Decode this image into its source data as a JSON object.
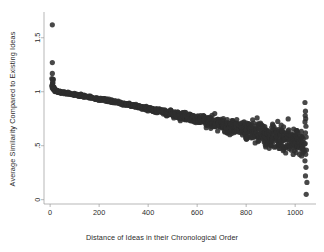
{
  "chart_data": {
    "type": "scatter",
    "title": "",
    "xlabel": "Distance of Ideas in their Chronological Order",
    "ylabel": "Average Similarity Compared to Existing Ideas",
    "xlim": [
      -25,
      1085
    ],
    "ylim": [
      -0.04,
      1.72
    ],
    "xticks": [
      0,
      200,
      400,
      600,
      800,
      1000
    ],
    "xtick_labels": [
      "0",
      "200",
      "400",
      "600",
      "800",
      "1000"
    ],
    "yticks": [
      0,
      0.5,
      1,
      1.5
    ],
    "ytick_labels": [
      "0",
      ".5",
      "1",
      "1.5"
    ],
    "grid": false,
    "legend": null,
    "marker": {
      "shape": "circle",
      "color": "#2f2f2f",
      "size": 2.6
    },
    "trend_line": {
      "color": "#8c8c8c",
      "width": 0.6,
      "points": [
        [
          20,
          1.03
        ],
        [
          200,
          0.93
        ],
        [
          400,
          0.85
        ],
        [
          600,
          0.77
        ],
        [
          800,
          0.66
        ],
        [
          950,
          0.58
        ],
        [
          1040,
          0.53
        ]
      ]
    },
    "series": [
      {
        "name": "Average similarity by chronological distance",
        "points": [
          [
            9,
            1.62
          ],
          [
            9,
            1.27
          ],
          [
            9,
            1.17
          ],
          [
            10,
            1.12
          ],
          [
            11,
            1.08
          ],
          [
            12,
            1.05
          ],
          [
            13,
            1.04
          ],
          [
            14,
            1.03
          ],
          [
            15,
            1.025
          ],
          [
            17,
            1.02
          ],
          [
            19,
            1.015
          ],
          [
            21,
            1.012
          ],
          [
            23,
            1.01
          ],
          [
            25,
            1.008
          ],
          [
            27,
            1.005
          ],
          [
            30,
            1.002
          ],
          [
            33,
            1.0
          ],
          [
            36,
            0.999
          ],
          [
            39,
            0.997
          ],
          [
            42,
            0.996
          ],
          [
            45,
            0.995
          ],
          [
            48,
            0.993
          ],
          [
            52,
            0.992
          ],
          [
            56,
            0.991
          ],
          [
            60,
            0.99
          ],
          [
            64,
            0.988
          ],
          [
            68,
            0.987
          ],
          [
            72,
            0.985
          ],
          [
            76,
            0.984
          ],
          [
            80,
            0.982
          ],
          [
            85,
            0.98
          ],
          [
            90,
            0.978
          ],
          [
            95,
            0.976
          ],
          [
            100,
            0.974
          ],
          [
            105,
            0.972
          ],
          [
            110,
            0.97
          ],
          [
            115,
            0.968
          ],
          [
            120,
            0.966
          ],
          [
            125,
            0.964
          ],
          [
            130,
            0.962
          ],
          [
            135,
            0.96
          ],
          [
            140,
            0.958
          ],
          [
            145,
            0.956
          ],
          [
            150,
            0.954
          ],
          [
            155,
            0.952
          ],
          [
            160,
            0.95
          ],
          [
            165,
            0.948
          ],
          [
            170,
            0.946
          ],
          [
            175,
            0.944
          ],
          [
            180,
            0.942
          ],
          [
            185,
            0.94
          ],
          [
            190,
            0.938
          ],
          [
            195,
            0.936
          ],
          [
            200,
            0.934
          ],
          [
            205,
            0.932
          ],
          [
            210,
            0.93
          ],
          [
            215,
            0.928
          ],
          [
            220,
            0.926
          ],
          [
            225,
            0.923
          ],
          [
            230,
            0.921
          ],
          [
            235,
            0.919
          ],
          [
            240,
            0.917
          ],
          [
            245,
            0.915
          ],
          [
            250,
            0.912
          ],
          [
            255,
            0.91
          ],
          [
            260,
            0.908
          ],
          [
            265,
            0.906
          ],
          [
            270,
            0.903
          ],
          [
            275,
            0.901
          ],
          [
            280,
            0.899
          ],
          [
            285,
            0.897
          ],
          [
            290,
            0.894
          ],
          [
            295,
            0.892
          ],
          [
            300,
            0.89
          ],
          [
            305,
            0.888
          ],
          [
            310,
            0.885
          ],
          [
            315,
            0.883
          ],
          [
            320,
            0.881
          ],
          [
            325,
            0.878
          ],
          [
            330,
            0.876
          ],
          [
            335,
            0.874
          ],
          [
            340,
            0.871
          ],
          [
            345,
            0.869
          ],
          [
            350,
            0.867
          ],
          [
            355,
            0.864
          ],
          [
            360,
            0.862
          ],
          [
            365,
            0.86
          ],
          [
            370,
            0.857
          ],
          [
            375,
            0.855
          ],
          [
            380,
            0.853
          ],
          [
            385,
            0.85
          ],
          [
            390,
            0.848
          ],
          [
            395,
            0.846
          ],
          [
            400,
            0.843
          ],
          [
            405,
            0.841
          ],
          [
            410,
            0.839
          ],
          [
            415,
            0.836
          ],
          [
            420,
            0.834
          ],
          [
            425,
            0.832
          ],
          [
            430,
            0.829
          ],
          [
            435,
            0.827
          ],
          [
            440,
            0.825
          ],
          [
            445,
            0.822
          ],
          [
            450,
            0.82
          ],
          [
            455,
            0.818
          ],
          [
            460,
            0.815
          ],
          [
            465,
            0.813
          ],
          [
            470,
            0.81
          ],
          [
            475,
            0.808
          ],
          [
            480,
            0.806
          ],
          [
            485,
            0.803
          ],
          [
            490,
            0.801
          ],
          [
            495,
            0.799
          ],
          [
            500,
            0.796
          ],
          [
            505,
            0.794
          ],
          [
            510,
            0.792
          ],
          [
            515,
            0.789
          ],
          [
            520,
            0.787
          ],
          [
            525,
            0.784
          ],
          [
            530,
            0.782
          ],
          [
            535,
            0.78
          ],
          [
            540,
            0.777
          ],
          [
            545,
            0.775
          ],
          [
            550,
            0.772
          ],
          [
            555,
            0.77
          ],
          [
            560,
            0.767
          ],
          [
            565,
            0.765
          ],
          [
            570,
            0.762
          ],
          [
            575,
            0.76
          ],
          [
            580,
            0.757
          ],
          [
            585,
            0.755
          ],
          [
            590,
            0.752
          ],
          [
            595,
            0.75
          ],
          [
            600,
            0.747
          ],
          [
            605,
            0.745
          ],
          [
            610,
            0.742
          ],
          [
            615,
            0.74
          ],
          [
            620,
            0.737
          ],
          [
            625,
            0.735
          ],
          [
            630,
            0.732
          ],
          [
            635,
            0.73
          ],
          [
            640,
            0.727
          ],
          [
            645,
            0.724
          ],
          [
            650,
            0.722
          ],
          [
            655,
            0.72
          ],
          [
            660,
            0.717
          ],
          [
            665,
            0.715
          ],
          [
            670,
            0.712
          ],
          [
            675,
            0.71
          ],
          [
            680,
            0.707
          ],
          [
            685,
            0.705
          ],
          [
            690,
            0.702
          ],
          [
            695,
            0.7
          ],
          [
            700,
            0.697
          ],
          [
            705,
            0.695
          ],
          [
            710,
            0.692
          ],
          [
            715,
            0.69
          ],
          [
            720,
            0.687
          ],
          [
            725,
            0.685
          ],
          [
            730,
            0.682
          ],
          [
            735,
            0.68
          ],
          [
            740,
            0.677
          ],
          [
            745,
            0.675
          ],
          [
            750,
            0.672
          ],
          [
            755,
            0.67
          ],
          [
            760,
            0.667
          ],
          [
            765,
            0.665
          ],
          [
            770,
            0.662
          ],
          [
            775,
            0.66
          ],
          [
            780,
            0.657
          ],
          [
            785,
            0.655
          ],
          [
            790,
            0.652
          ],
          [
            795,
            0.65
          ],
          [
            800,
            0.647
          ],
          [
            805,
            0.645
          ],
          [
            810,
            0.642
          ],
          [
            815,
            0.64
          ],
          [
            820,
            0.637
          ],
          [
            825,
            0.635
          ],
          [
            830,
            0.632
          ],
          [
            835,
            0.63
          ],
          [
            840,
            0.627
          ],
          [
            845,
            0.625
          ],
          [
            850,
            0.622
          ],
          [
            855,
            0.62
          ],
          [
            860,
            0.617
          ],
          [
            865,
            0.615
          ],
          [
            870,
            0.612
          ],
          [
            875,
            0.61
          ],
          [
            880,
            0.607
          ],
          [
            885,
            0.605
          ],
          [
            890,
            0.602
          ],
          [
            895,
            0.6
          ],
          [
            900,
            0.597
          ],
          [
            905,
            0.595
          ],
          [
            910,
            0.592
          ],
          [
            915,
            0.59
          ],
          [
            920,
            0.587
          ],
          [
            925,
            0.585
          ],
          [
            930,
            0.582
          ],
          [
            935,
            0.58
          ],
          [
            940,
            0.577
          ],
          [
            945,
            0.575
          ],
          [
            950,
            0.572
          ],
          [
            955,
            0.57
          ],
          [
            960,
            0.567
          ],
          [
            965,
            0.565
          ],
          [
            970,
            0.562
          ],
          [
            975,
            0.56
          ],
          [
            980,
            0.557
          ],
          [
            985,
            0.555
          ],
          [
            990,
            0.552
          ],
          [
            995,
            0.55
          ],
          [
            1000,
            0.547
          ],
          [
            1005,
            0.545
          ],
          [
            1010,
            0.542
          ],
          [
            1015,
            0.54
          ],
          [
            1020,
            0.537
          ],
          [
            1025,
            0.535
          ],
          [
            1030,
            0.532
          ],
          [
            1035,
            0.53
          ],
          [
            1040,
            0.9
          ],
          [
            1042,
            0.82
          ],
          [
            1041,
            0.78
          ],
          [
            1043,
            0.75
          ],
          [
            1040,
            0.72
          ],
          [
            1044,
            0.68
          ],
          [
            1042,
            0.62
          ],
          [
            1045,
            0.58
          ],
          [
            1041,
            0.52
          ],
          [
            1046,
            0.46
          ],
          [
            1043,
            0.42
          ],
          [
            1040,
            0.36
          ],
          [
            1044,
            0.3
          ],
          [
            1042,
            0.22
          ],
          [
            1048,
            0.16
          ],
          [
            1045,
            0.05
          ]
        ],
        "scatter_noise": {
          "description": "vertical spread of points about the mean trend, increasing with distance",
          "spread_start": 0.012,
          "spread_end": 0.17,
          "spread_onset_x": 300
        }
      }
    ],
    "notes": [
      "Dense band of points declines from about 1.15 at small distance to about 0.53 near distance 1040",
      "Scatter spread widens markedly beyond distance 600",
      "Three isolated high outliers near distance 10 at roughly 1.62, 1.27 and 1.17",
      "A near-vertical column of sparse outliers sits at the right edge near distance 1040-1050"
    ]
  }
}
